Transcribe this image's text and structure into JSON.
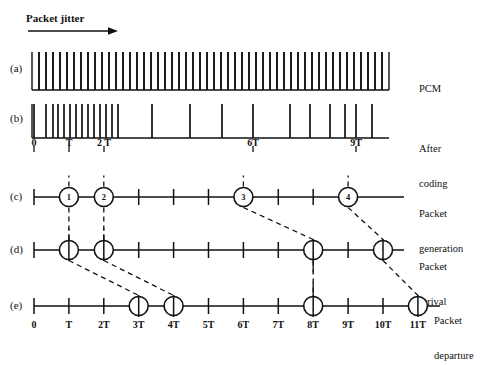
{
  "figure": {
    "title_annotation": "Packet jitter",
    "arrow_icon": "right-arrow-icon",
    "background": "#ffffff",
    "ink": "#111111"
  },
  "geometry": {
    "axis_x0": 34,
    "tick_spacing": 34.9,
    "axis_x_end": 440,
    "row_a_baseline": 90,
    "row_b_baseline": 138,
    "row_c_baseline": 197,
    "row_d_baseline": 250,
    "row_e_baseline": 306
  },
  "rows": [
    {
      "tag": "(a)",
      "tag_x": 10,
      "tag_y": 68,
      "side_label": "PCM",
      "side_label_lines": [
        "PCM"
      ],
      "side_x": 419,
      "side_y": 64,
      "type": "pulse-train",
      "baseline_y": 90,
      "x_start": 32,
      "x_end": 389,
      "pulse_count": 52,
      "pulse_height": 38,
      "description": "uniform dense PCM sample pulses"
    },
    {
      "tag": "(b)",
      "tag_x": 10,
      "tag_y": 118,
      "side_label": "After coding",
      "side_label_lines": [
        "After",
        "coding"
      ],
      "side_x": 419,
      "side_y": 124,
      "type": "pulse-train-irregular",
      "baseline_y": 138,
      "x_start": 32,
      "x_end": 389,
      "pulse_height": 34,
      "pulse_positions": [
        34,
        46,
        53,
        58,
        64,
        70,
        76,
        82,
        88,
        94,
        100,
        106,
        112,
        118,
        152,
        190,
        222,
        253,
        290,
        310,
        330,
        345,
        356,
        372
      ],
      "axis_ticks": [
        {
          "label": "0",
          "x": 34
        },
        {
          "label": "T",
          "x": 69
        },
        {
          "label": "2 T",
          "x": 104
        },
        {
          "label": "6T",
          "x": 253
        },
        {
          "label": "9T",
          "x": 356
        }
      ]
    },
    {
      "tag": "(c)",
      "tag_x": 10,
      "tag_y": 190,
      "side_label": "Packet generation",
      "side_label_lines": [
        "Packet",
        "generation"
      ],
      "side_x": 419,
      "side_y": 190,
      "type": "timeline",
      "baseline_y": 197,
      "x_start": 34,
      "x_end": 404,
      "ticks_at": [
        0,
        1,
        2,
        3,
        4,
        5,
        6,
        7,
        8,
        9
      ],
      "markers": [
        {
          "at": 1,
          "label": "1",
          "kind": "numbered-circle"
        },
        {
          "at": 2,
          "label": "2",
          "kind": "numbered-circle"
        },
        {
          "at": 6,
          "label": "3",
          "kind": "numbered-circle"
        },
        {
          "at": 9,
          "label": "4",
          "kind": "numbered-circle"
        }
      ]
    },
    {
      "tag": "(d)",
      "tag_x": 10,
      "tag_y": 243,
      "side_label": "Packet arrival",
      "side_label_lines": [
        "Packet",
        "arrival"
      ],
      "side_x": 419,
      "side_y": 243,
      "type": "timeline",
      "baseline_y": 250,
      "x_start": 34,
      "x_end": 404,
      "ticks_at": [
        0,
        1,
        2,
        3,
        4,
        5,
        6,
        7,
        8,
        9,
        10
      ],
      "markers": [
        {
          "at": 1,
          "label": "",
          "kind": "crossed-circle"
        },
        {
          "at": 2,
          "label": "",
          "kind": "crossed-circle"
        },
        {
          "at": 8,
          "label": "",
          "kind": "crossed-circle"
        },
        {
          "at": 10,
          "label": "",
          "kind": "crossed-circle"
        }
      ]
    },
    {
      "tag": "(e)",
      "tag_x": 10,
      "tag_y": 299,
      "side_label": "Packet departure",
      "side_label_lines": [
        "Packet",
        "departure"
      ],
      "side_x": 434,
      "side_y": 297,
      "type": "timeline",
      "baseline_y": 306,
      "x_start": 34,
      "x_end": 440,
      "ticks_at": [
        0,
        1,
        2,
        3,
        4,
        5,
        6,
        7,
        8,
        9,
        10,
        11
      ],
      "markers": [
        {
          "at": 3,
          "label": "",
          "kind": "crossed-circle"
        },
        {
          "at": 4,
          "label": "",
          "kind": "crossed-circle"
        },
        {
          "at": 8,
          "label": "",
          "kind": "crossed-circle"
        },
        {
          "at": 11,
          "label": "",
          "kind": "crossed-circle"
        }
      ],
      "axis_labels": [
        "0",
        "T",
        "2T",
        "3T",
        "4T",
        "5T",
        "6T",
        "7T",
        "8T",
        "9T",
        "10T",
        "11T"
      ]
    }
  ],
  "connectors": [
    {
      "from_row": "c",
      "from_at": 1,
      "to_row": "d",
      "to_at": 1,
      "style": "dashed"
    },
    {
      "from_row": "c",
      "from_at": 2,
      "to_row": "d",
      "to_at": 2,
      "style": "dashed"
    },
    {
      "from_row": "c",
      "from_at": 6,
      "to_row": "d",
      "to_at": 8,
      "style": "dashed"
    },
    {
      "from_row": "c",
      "from_at": 9,
      "to_row": "d",
      "to_at": 10,
      "style": "dashed"
    },
    {
      "from_row": "d",
      "from_at": 1,
      "to_row": "e",
      "to_at": 3,
      "style": "dashed"
    },
    {
      "from_row": "d",
      "from_at": 2,
      "to_row": "e",
      "to_at": 4,
      "style": "dashed"
    },
    {
      "from_row": "d",
      "from_at": 8,
      "to_row": "e",
      "to_at": 8,
      "style": "dashed"
    },
    {
      "from_row": "d",
      "from_at": 10,
      "to_row": "e",
      "to_at": 11,
      "style": "dashed"
    }
  ],
  "chart_data": {
    "type": "timeline",
    "title": "Packet jitter",
    "xlabel": "",
    "ylabel": "",
    "xlim": [
      0,
      11
    ],
    "xtick_labels": [
      "0",
      "T",
      "2T",
      "3T",
      "4T",
      "5T",
      "6T",
      "7T",
      "8T",
      "9T",
      "10T",
      "11T"
    ],
    "grid": false,
    "legend": "none",
    "series": [
      {
        "name": "PCM",
        "row": "a",
        "kind": "uniform-pulse-train",
        "pulse_count": 52
      },
      {
        "name": "After coding",
        "row": "b",
        "kind": "irregular-pulse-train",
        "pulse_positions_px": [
          34,
          46,
          53,
          58,
          64,
          70,
          76,
          82,
          88,
          94,
          100,
          106,
          112,
          118,
          152,
          190,
          222,
          253,
          290,
          310,
          330,
          345,
          356,
          372
        ]
      },
      {
        "name": "Packet generation",
        "row": "c",
        "kind": "events",
        "events_at_T": [
          1,
          2,
          6,
          9
        ],
        "event_ids": [
          1,
          2,
          3,
          4
        ]
      },
      {
        "name": "Packet arrival",
        "row": "d",
        "kind": "events",
        "events_at_T": [
          1,
          2,
          8,
          10
        ],
        "event_ids": [
          1,
          2,
          3,
          4
        ]
      },
      {
        "name": "Packet departure",
        "row": "e",
        "kind": "events",
        "events_at_T": [
          3,
          4,
          8,
          11
        ],
        "event_ids": [
          1,
          2,
          3,
          4
        ]
      }
    ]
  }
}
